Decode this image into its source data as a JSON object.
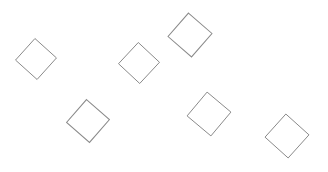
{
  "figure": {
    "width": 328,
    "height": 172,
    "background_color": "#ffffff",
    "stroke_color": "#8a8a8a",
    "stroke_width": 1,
    "fill": "none",
    "shape_count": 6
  },
  "chart_data": {
    "type": "scatter",
    "title": "",
    "subtitle": "",
    "xlabel": "",
    "ylabel": "",
    "xlim": [
      0,
      328
    ],
    "ylim": [
      0,
      172
    ],
    "grid": false,
    "legend": null,
    "marker": "diamond",
    "marker_style": "open",
    "marker_edge_color": "#8a8a8a",
    "marker_face_color": "none",
    "marker_edge_width": 1,
    "series": [
      {
        "name": "diamonds",
        "points": [
          {
            "id": 1,
            "label": "diamond-1",
            "cx": 36,
            "cy": 59,
            "radius": 20.5,
            "rotation": -3
          },
          {
            "id": 2,
            "label": "diamond-2",
            "cx": 139,
            "cy": 63,
            "radius": 20.5,
            "rotation": -2
          },
          {
            "id": 3,
            "label": "diamond-3",
            "cx": 190,
            "cy": 35,
            "radius": 22,
            "rotation": -4
          },
          {
            "id": 4,
            "label": "diamond-4",
            "cx": 88,
            "cy": 121,
            "radius": 21.5,
            "rotation": -4
          },
          {
            "id": 5,
            "label": "diamond-5",
            "cx": 209,
            "cy": 114,
            "radius": 22,
            "rotation": -5
          },
          {
            "id": 6,
            "label": "diamond-6",
            "cx": 287,
            "cy": 136,
            "radius": 22,
            "rotation": -3
          }
        ]
      }
    ]
  }
}
